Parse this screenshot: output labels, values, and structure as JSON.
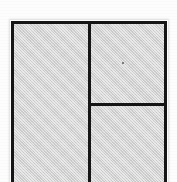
{
  "image": {
    "kind": "scanned-line-drawing",
    "subject": "partitioned-rectangle",
    "description": "Rectangle divided by one vertical rule and one horizontal rule into three gray panels",
    "width": 177,
    "height": 182,
    "background_color": "#fdfdfd",
    "cropped_at_bottom": true
  },
  "figure": {
    "outline": {
      "name": "outer-rectangle",
      "left": 11,
      "top": 21,
      "right": 167,
      "bottom": 182,
      "stroke_color": "#151515",
      "stroke_width": 3,
      "fill_color": "#d2d2d2"
    },
    "dividers": [
      {
        "name": "vertical-divider",
        "orientation": "vertical",
        "position": 88,
        "from": 21,
        "to": 182,
        "stroke_color": "#151515",
        "stroke_width": 3
      },
      {
        "name": "horizontal-divider",
        "orientation": "horizontal",
        "position": 103,
        "from": 88,
        "to": 167,
        "stroke_color": "#151515",
        "stroke_width": 3
      }
    ],
    "panels": [
      {
        "name": "left-panel",
        "label": "",
        "left": 14,
        "top": 24,
        "width": 74,
        "height": 158,
        "fill_color": "#d2d2d2"
      },
      {
        "name": "upper-right-panel",
        "label": "",
        "left": 91,
        "top": 24,
        "width": 73,
        "height": 79,
        "fill_color": "#d2d2d2"
      },
      {
        "name": "lower-right-panel",
        "label": "",
        "left": 91,
        "top": 106,
        "width": 73,
        "height": 76,
        "fill_color": "#d2d2d2"
      }
    ],
    "artifacts": [
      {
        "name": "scan-speck",
        "left": 122,
        "top": 62,
        "size": 2,
        "color": "#5a5a5a"
      }
    ]
  }
}
